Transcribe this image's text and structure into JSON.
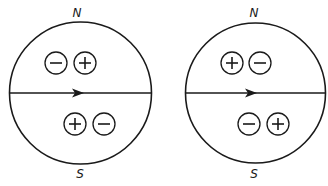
{
  "diagrams": [
    {
      "id": "left",
      "top_label": "N",
      "bottom_label": "S",
      "cx": 80.5,
      "cy": 93,
      "r": 71,
      "upper_charges": [
        {
          "sign": "minus",
          "symbol": "−",
          "x": 56,
          "y": 63
        },
        {
          "sign": "plus",
          "symbol": "+",
          "x": 85,
          "y": 63
        }
      ],
      "lower_charges": [
        {
          "sign": "plus",
          "symbol": "+",
          "x": 75,
          "y": 124
        },
        {
          "sign": "minus",
          "symbol": "−",
          "x": 104,
          "y": 124
        }
      ],
      "arrow_direction": "right"
    },
    {
      "id": "right",
      "top_label": "N",
      "bottom_label": "S",
      "cx": 255.5,
      "cy": 93,
      "r": 70,
      "upper_charges": [
        {
          "sign": "plus",
          "symbol": "+",
          "x": 232,
          "y": 63
        },
        {
          "sign": "minus",
          "symbol": "−",
          "x": 260,
          "y": 63
        }
      ],
      "lower_charges": [
        {
          "sign": "minus",
          "symbol": "−",
          "x": 249,
          "y": 124
        },
        {
          "sign": "plus",
          "symbol": "+",
          "x": 278,
          "y": 124
        }
      ],
      "arrow_direction": "right"
    }
  ],
  "colors": {
    "stroke": "#1a1a1a",
    "background": "#ffffff"
  }
}
